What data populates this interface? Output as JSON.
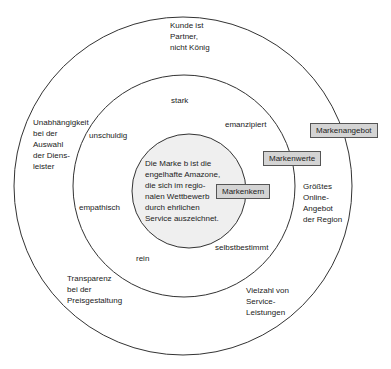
{
  "diagram": {
    "colors": {
      "background": "#ffffff",
      "ring_stroke": "#333333",
      "core_fill": "#efefef",
      "tag_fill": "#d4d4d4",
      "tag_border": "#555555"
    },
    "layers": {
      "outer": {
        "tag": "Markenangebot",
        "items": [
          "Kunde ist Partner, nicht König",
          "Unabhängigkeit bei der Auswahl der Diens- leister",
          "Größtes Online- Angebot der Region",
          "Transparenz bei der Preisgestaltung",
          "Vielzahl von Service- Leistungen"
        ]
      },
      "middle": {
        "tag": "Markenwerte",
        "items": [
          "stark",
          "unschuldig",
          "emanzipiert",
          "empathisch",
          "selbstbestimmt",
          "rein"
        ]
      },
      "core": {
        "tag": "Markenkern",
        "lines": [
          "Die Marke b ist die",
          "engelhafte Amazone,",
          "die sich im regio-",
          "nalen Wettbewerb",
          "durch ehrlichen",
          "Service auszeichnet."
        ]
      }
    },
    "outer_labels": {
      "top": [
        "Kunde ist",
        "Partner,",
        "nicht König"
      ],
      "left": [
        "Unabhängigkeit",
        "bei der",
        "Auswahl",
        "der Diens-",
        "leister"
      ],
      "right": [
        "Größtes",
        "Online-",
        "Angebot",
        "der Region"
      ],
      "bottom_left": [
        "Transparenz",
        "bei der",
        "Preisgestaltung"
      ],
      "bottom_right": [
        "Vielzahl von",
        "Service-",
        "Leistungen"
      ]
    },
    "middle_labels": {
      "top": "stark",
      "upper_left": "unschuldig",
      "upper_right": "emanzipiert",
      "lower_left": "empathisch",
      "lower_right": "selbstbestimmt",
      "bottom": "rein"
    }
  }
}
